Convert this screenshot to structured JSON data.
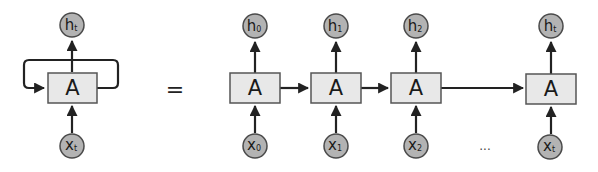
{
  "diagram": {
    "colors": {
      "box_fill": "#e8e8e8",
      "node_fill": "#b3b3b3",
      "edge": "#222222"
    },
    "folded": {
      "cell_label": "A",
      "output": {
        "base": "h",
        "sub": "t"
      },
      "input": {
        "base": "x",
        "sub": "t"
      }
    },
    "equals": "=",
    "unrolled": [
      {
        "cell_label": "A",
        "output": {
          "base": "h",
          "sub": "0"
        },
        "input": {
          "base": "x",
          "sub": "0"
        }
      },
      {
        "cell_label": "A",
        "output": {
          "base": "h",
          "sub": "1"
        },
        "input": {
          "base": "x",
          "sub": "1"
        }
      },
      {
        "cell_label": "A",
        "output": {
          "base": "h",
          "sub": "2"
        },
        "input": {
          "base": "x",
          "sub": "2"
        }
      },
      {
        "cell_label": "A",
        "output": {
          "base": "h",
          "sub": "t"
        },
        "input": {
          "base": "x",
          "sub": "t"
        }
      }
    ],
    "ellipsis": "..."
  }
}
